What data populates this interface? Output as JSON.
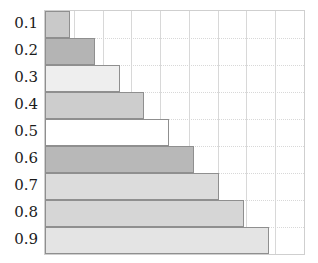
{
  "chart_data": {
    "type": "bar",
    "orientation": "horizontal",
    "title": "",
    "subtitle": "",
    "xlabel": "",
    "ylabel": "",
    "categories": [
      "0.1",
      "0.2",
      "0.3",
      "0.4",
      "0.5",
      "0.6",
      "0.7",
      "0.8",
      "0.9"
    ],
    "values": [
      0.1,
      0.2,
      0.3,
      0.4,
      0.5,
      0.6,
      0.7,
      0.8,
      0.9
    ],
    "xlim": [
      0,
      1.0
    ],
    "ylim_categories": 9,
    "grid": true,
    "grid_axis": "both",
    "grid_vertical_count": 9,
    "legend": null,
    "legend_position": "none",
    "xtick_labels": [],
    "ytick_labels": [
      "0.1",
      "0.2",
      "0.3",
      "0.4",
      "0.5",
      "0.6",
      "0.7",
      "0.8",
      "0.9"
    ],
    "bar_fill_colors": [
      "#c9c9c9",
      "#b4b4b4",
      "#eeeeee",
      "#cdcdcd",
      "#ffffff",
      "#b8b8b8",
      "#dcdcdc",
      "#d6d6d6",
      "#e4e4e4"
    ],
    "bar_edge_color": "#8f8f8f",
    "grid_color": "#d8d8d8",
    "plot_border_color": "#cfcfcf",
    "background_color": "#ffffff",
    "label_text_color": "#1b1b1b",
    "bars": [
      {
        "label": "0.1",
        "value": 0.1,
        "fill": "#c9c9c9"
      },
      {
        "label": "0.2",
        "value": 0.2,
        "fill": "#b4b4b4"
      },
      {
        "label": "0.3",
        "value": 0.3,
        "fill": "#eeeeee"
      },
      {
        "label": "0.4",
        "value": 0.4,
        "fill": "#cdcdcd"
      },
      {
        "label": "0.5",
        "value": 0.5,
        "fill": "#ffffff"
      },
      {
        "label": "0.6",
        "value": 0.6,
        "fill": "#b8b8b8"
      },
      {
        "label": "0.7",
        "value": 0.7,
        "fill": "#dcdcdc"
      },
      {
        "label": "0.8",
        "value": 0.8,
        "fill": "#d6d6d6"
      },
      {
        "label": "0.9",
        "value": 0.9,
        "fill": "#e4e4e4"
      }
    ]
  }
}
